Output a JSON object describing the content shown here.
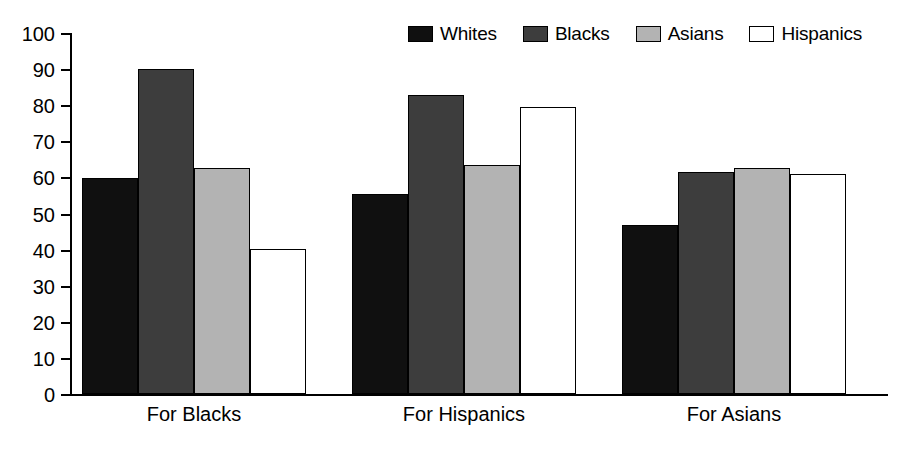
{
  "chart_data": {
    "type": "bar",
    "title": "",
    "subtitle": "",
    "xlabel": "",
    "ylabel": "",
    "categories": [
      "For Blacks",
      "For Hispanics",
      "For Asians"
    ],
    "series": [
      {
        "name": "Whites",
        "color": "#101010",
        "values": [
          59.8,
          55.5,
          46.8
        ]
      },
      {
        "name": "Blacks",
        "color": "#3d3d3d",
        "values": [
          90.0,
          82.8,
          61.5
        ]
      },
      {
        "name": "Asians",
        "color": "#b3b3b3",
        "values": [
          62.5,
          63.5,
          62.5
        ]
      },
      {
        "name": "Hispanics",
        "color": "#ffffff",
        "values": [
          40.3,
          79.5,
          61.0
        ]
      }
    ],
    "ylim": [
      0,
      100
    ],
    "yticks": [
      0,
      10,
      20,
      30,
      40,
      50,
      60,
      70,
      80,
      90,
      100
    ],
    "ytick_labels": [
      "0",
      "10",
      "20",
      "30",
      "40",
      "50",
      "60",
      "70",
      "80",
      "90",
      "100"
    ],
    "grid": false,
    "legend_position": "top-right",
    "bar_border_color": "#000000",
    "axis_color": "#000000",
    "background": "#ffffff"
  },
  "legend": {
    "entries": [
      {
        "label": "Whites",
        "color": "#101010"
      },
      {
        "label": "Blacks",
        "color": "#3d3d3d"
      },
      {
        "label": "Asians",
        "color": "#b3b3b3"
      },
      {
        "label": "Hispanics",
        "color": "#ffffff"
      }
    ]
  }
}
